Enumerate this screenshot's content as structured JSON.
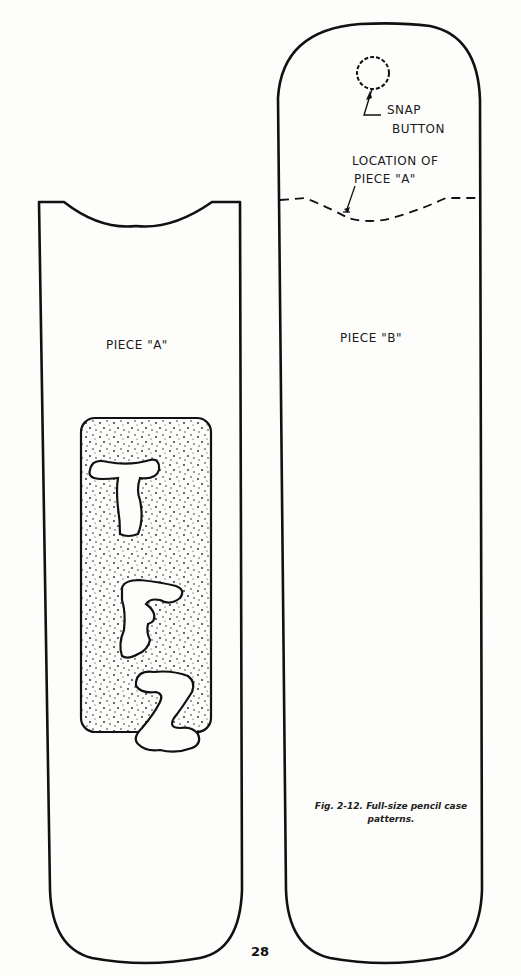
{
  "piece_a": {
    "label": "PIECE \"A\"",
    "monogram": [
      "T",
      "F",
      "Z"
    ]
  },
  "piece_b": {
    "label": "PIECE \"B\"",
    "snap_label_line1": "SNAP",
    "snap_label_line2": "BUTTON",
    "location_label_line1": "LOCATION OF",
    "location_label_line2": "PIECE \"A\""
  },
  "caption": {
    "line1": "Fig. 2-12.  Full-size pencil case",
    "line2": "patterns."
  },
  "page_number": "28"
}
